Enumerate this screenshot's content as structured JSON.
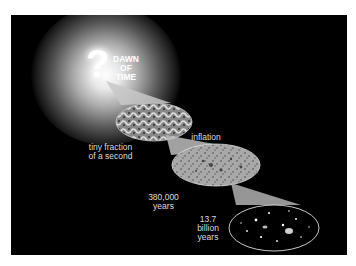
{
  "diagram": {
    "title_lines": [
      "DAWN",
      "OF",
      "TIME"
    ],
    "origin_symbol": "?",
    "stages": [
      {
        "label_lines": [
          "tiny fraction",
          "of a second"
        ],
        "image": "quantum-fluctuations-ellipse"
      },
      {
        "label_lines": [
          "inflation"
        ],
        "image": "inflation-arrow"
      },
      {
        "label_lines": [
          "380,000",
          "years"
        ],
        "image": "cosmic-microwave-background-ellipse"
      },
      {
        "label_lines": [
          "13.7",
          "billion",
          "years"
        ],
        "image": "galaxies-ellipse"
      }
    ],
    "colors": {
      "background": "#000000",
      "page": "#ffffff",
      "text": "#dddddd",
      "glow": "#ffffff"
    }
  }
}
